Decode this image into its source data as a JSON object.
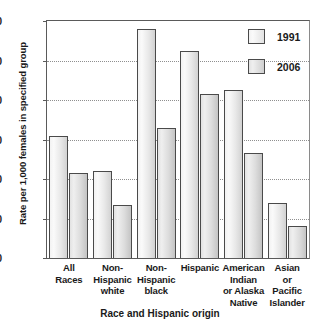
{
  "chart_data": {
    "type": "bar",
    "title": "",
    "xlabel": "Race and Hispanic origin",
    "ylabel": "Rate per 1,000 females in specified group",
    "categories": [
      "All Races",
      "Non-Hispanic white",
      "Non-Hispanic black",
      "Hispanic",
      "American Indian or Alaska Native",
      "Asian or Pacific Islander"
    ],
    "category_lines": [
      [
        "All",
        "Races"
      ],
      [
        "Non-",
        "Hispanic",
        "white"
      ],
      [
        "Non-",
        "Hispanic",
        "black"
      ],
      [
        "Hispanic"
      ],
      [
        "American",
        "Indian",
        "or Alaska",
        "Native"
      ],
      [
        "Asian",
        "or",
        "Pacific",
        "Islander"
      ]
    ],
    "series": [
      {
        "name": "1991",
        "values": [
          62,
          44,
          116,
          105,
          85,
          28
        ]
      },
      {
        "name": "2006",
        "values": [
          43,
          27,
          66,
          83,
          53,
          16
        ]
      }
    ],
    "legend": [
      "1991",
      "2006"
    ],
    "legend_position": "top-right-inside",
    "ylim": [
      0,
      120
    ],
    "yticks": [
      0,
      20,
      40,
      60,
      80,
      100,
      120
    ],
    "ytick_labels": [
      "0",
      "20",
      "40",
      "60",
      "80",
      "100",
      "120"
    ],
    "grid": "horizontal-dotted",
    "colors": {
      "series_1991": "#efefef",
      "series_2006": "#dcdcdc",
      "bar_outline": "#4a4a4a",
      "gridline": "#8f8f8f",
      "axis": "#5a5a5a",
      "text": "#1a1a1a"
    }
  }
}
